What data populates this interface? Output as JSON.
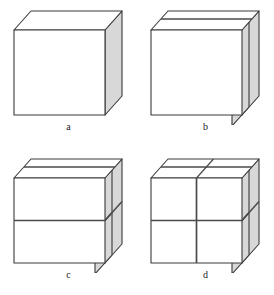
{
  "figure": {
    "type": "geometric-diagram",
    "background_color": "#ffffff",
    "panel_count": 4
  },
  "style": {
    "outline_color": "#3a3a3a",
    "cut_line_color": "#4a4a4a",
    "side_face_fill": "#d8d8d8",
    "top_face_fill": "#ffffff",
    "front_face_fill": "#ffffff",
    "outline_width": 1.1,
    "cut_line_width": 1.6,
    "label_color": "#1a1a1a",
    "label_font_size": 10
  },
  "geometry": {
    "front_left_x": 14,
    "front_right_x": 105,
    "front_top_y": 30,
    "front_bottom_y": 115,
    "depth_dx": 17,
    "depth_dy": -19,
    "slab_offset": 10,
    "mid_x": 59.5,
    "mid_y": 72.5
  },
  "panels": [
    {
      "id": "a",
      "label": "a",
      "cuts": {
        "depth_slice": false,
        "horizontal_cut": false,
        "vertical_cut": false
      },
      "piece_count": 1,
      "caption": "Undivided cube"
    },
    {
      "id": "b",
      "label": "b",
      "cuts": {
        "depth_slice": true,
        "horizontal_cut": false,
        "vertical_cut": false
      },
      "piece_count": 2,
      "caption": "Cube sliced once along the depth direction"
    },
    {
      "id": "c",
      "label": "c",
      "cuts": {
        "depth_slice": true,
        "horizontal_cut": true,
        "vertical_cut": false
      },
      "piece_count": 4,
      "caption": "Cube sliced along depth and horizontally"
    },
    {
      "id": "d",
      "label": "d",
      "cuts": {
        "depth_slice": true,
        "horizontal_cut": true,
        "vertical_cut": true
      },
      "piece_count": 8,
      "caption": "Cube sliced along depth, horizontally and vertically"
    }
  ]
}
